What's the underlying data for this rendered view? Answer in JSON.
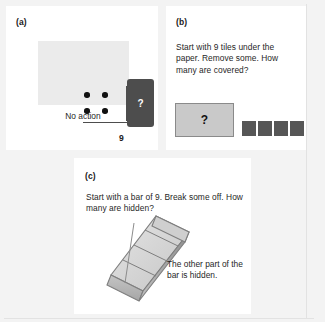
{
  "figure": {
    "background_color": "#f3f3f3",
    "panel_background_color": "#ffffff"
  },
  "panels": [
    {
      "id": "a",
      "label": "(a)",
      "caption": "No action",
      "total_label": "9",
      "card_glyph": "?",
      "dot_count": 4,
      "gray_box_color": "#ebebeb",
      "card_color": "#4d4d4d",
      "dot_color": "#111111"
    },
    {
      "id": "b",
      "label": "(b)",
      "prompt": "Start with 9 tiles under the paper. Remove some. How many are covered?",
      "cover_glyph": "?",
      "cover_color": "#c9c9c9",
      "cover_border_color": "#8a8a8a",
      "tile_color": "#565656",
      "tile_count": 4
    },
    {
      "id": "c",
      "label": "(c)",
      "prompt": "Start with a bar of 9. Break some off. How many are hidden?",
      "note": "The other part of the bar is hidden.",
      "bar_cube_count": 4,
      "bar_color_top": "#d8d8d8",
      "bar_color_front": "#b8b8b8",
      "bar_color_side": "#9a9a9a"
    }
  ]
}
